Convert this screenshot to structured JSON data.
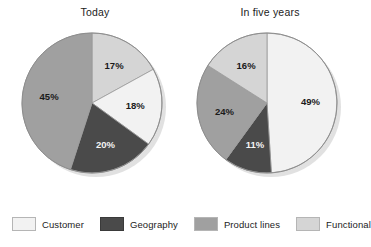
{
  "chart_data": {
    "type": "pie",
    "title": "",
    "subtitle": "",
    "xlabel": "",
    "ylabel": "",
    "legend_position": "bottom",
    "grid": false,
    "value_suffix": "%",
    "categories": [
      "Customer",
      "Geography",
      "Product lines",
      "Functional"
    ],
    "colors": {
      "Customer": "#f2f2f2",
      "Geography": "#4a4a4a",
      "Product lines": "#a0a0a0",
      "Functional": "#d5d5d5"
    },
    "charts": [
      {
        "title": "Today",
        "start_angle_deg": 0,
        "direction": "clockwise",
        "slices": [
          {
            "label": "Functional",
            "value": 17,
            "display": "17%",
            "color": "#d5d5d5",
            "label_color": "dark"
          },
          {
            "label": "Customer",
            "value": 18,
            "display": "18%",
            "color": "#f2f2f2",
            "label_color": "dark"
          },
          {
            "label": "Geography",
            "value": 20,
            "display": "20%",
            "color": "#4a4a4a",
            "label_color": "light"
          },
          {
            "label": "Product lines",
            "value": 45,
            "display": "45%",
            "color": "#a0a0a0",
            "label_color": "dark"
          }
        ]
      },
      {
        "title": "In five years",
        "start_angle_deg": 0,
        "direction": "clockwise",
        "slices": [
          {
            "label": "Customer",
            "value": 49,
            "display": "49%",
            "color": "#f2f2f2",
            "label_color": "dark"
          },
          {
            "label": "Geography",
            "value": 11,
            "display": "11%",
            "color": "#4a4a4a",
            "label_color": "light"
          },
          {
            "label": "Product lines",
            "value": 24,
            "display": "24%",
            "color": "#a0a0a0",
            "label_color": "dark"
          },
          {
            "label": "Functional",
            "value": 16,
            "display": "16%",
            "color": "#d5d5d5",
            "label_color": "dark"
          }
        ]
      }
    ],
    "legend": [
      {
        "label": "Customer",
        "color": "#f2f2f2"
      },
      {
        "label": "Geography",
        "color": "#4a4a4a"
      },
      {
        "label": "Product lines",
        "color": "#a0a0a0"
      },
      {
        "label": "Functional",
        "color": "#d5d5d5"
      }
    ]
  }
}
